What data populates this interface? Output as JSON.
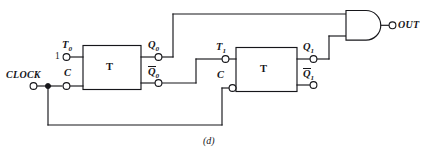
{
  "figure": {
    "caption": "(d)",
    "type": "logic-circuit-schematic"
  },
  "signals": {
    "clock_label": "CLOCK",
    "constant_one": "1",
    "out_label": "OUT"
  },
  "flipflops": [
    {
      "id": "ff0",
      "body_label": "T",
      "inputs": [
        {
          "name": "T0",
          "letter": "T",
          "subscript": "0",
          "overbar": false
        },
        {
          "name": "C0",
          "letter": "C",
          "subscript": "",
          "overbar": false
        }
      ],
      "outputs": [
        {
          "name": "Q0",
          "letter": "Q",
          "subscript": "0",
          "overbar": false
        },
        {
          "name": "Q0bar",
          "letter": "Q",
          "subscript": "0",
          "overbar": true
        }
      ]
    },
    {
      "id": "ff1",
      "body_label": "T",
      "inputs": [
        {
          "name": "T1",
          "letter": "T",
          "subscript": "1",
          "overbar": false
        },
        {
          "name": "C1",
          "letter": "C",
          "subscript": "",
          "overbar": false
        }
      ],
      "outputs": [
        {
          "name": "Q1",
          "letter": "Q",
          "subscript": "1",
          "overbar": false
        },
        {
          "name": "Q1bar",
          "letter": "Q",
          "subscript": "1",
          "overbar": true
        }
      ]
    }
  ],
  "gate": {
    "type": "AND",
    "input_count": 2,
    "inputs": [
      "Q0",
      "Q1"
    ],
    "output": "OUT"
  },
  "colors": {
    "wire": "#16161a",
    "text": "#16161a",
    "background": "#ffffff"
  }
}
